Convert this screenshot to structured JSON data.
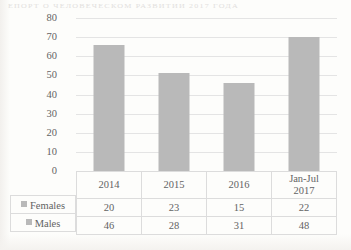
{
  "scan": {
    "bleed_text": "ЕПОРТ О ЧЕЛОВЕЧЕСКОМ РАЗВИТИИ 2017 ГОДА"
  },
  "chart_data": {
    "type": "bar",
    "title": "",
    "subtitle": "",
    "xlabel": "",
    "ylabel": "",
    "categories": [
      "2014",
      "2015",
      "2016",
      "Jan-Jul 2017"
    ],
    "category_lines": [
      [
        "2014"
      ],
      [
        "2015"
      ],
      [
        "2016"
      ],
      [
        "Jan-Jul",
        "2017"
      ]
    ],
    "values": [
      66,
      51,
      46,
      70
    ],
    "series": [
      {
        "name": "Females",
        "values": [
          20,
          23,
          15,
          22
        ]
      },
      {
        "name": "Males",
        "values": [
          46,
          28,
          31,
          48
        ]
      }
    ],
    "ylim": [
      0,
      80
    ],
    "ytick_step": 10,
    "yticks": [
      "80",
      "70",
      "60",
      "50",
      "40",
      "30",
      "20",
      "10",
      "0"
    ],
    "grid": true,
    "legend_position": "data-table-first-column",
    "data_table_shown": true,
    "bar_color": "#b9b9b9",
    "gridline_color": "#e4e4e4",
    "text_color": "#636363",
    "annotations": []
  },
  "table": {
    "rows": [
      {
        "label": "Females",
        "marker": "legend-swatch-females",
        "cells": [
          "20",
          "23",
          "15",
          "22"
        ]
      },
      {
        "label": "Males",
        "marker": "legend-swatch-males",
        "cells": [
          "46",
          "28",
          "31",
          "48"
        ]
      }
    ]
  }
}
